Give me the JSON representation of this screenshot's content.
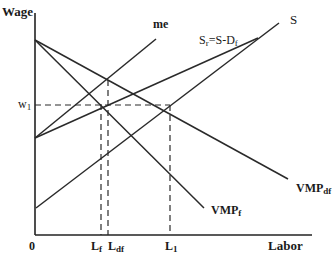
{
  "diagram": {
    "type": "labor-market-supply-demand",
    "axes": {
      "y_label": "Wage",
      "x_label": "Labor",
      "origin_label": "0"
    },
    "wage_levels": [
      {
        "label": "w",
        "subscript": "1"
      }
    ],
    "labor_levels": [
      {
        "label": "L",
        "subscript": "f"
      },
      {
        "label": "L",
        "subscript": "df"
      },
      {
        "label": "L",
        "subscript": "1"
      }
    ],
    "curves": [
      {
        "id": "vmp_df",
        "label": "VMP",
        "subscript": "df",
        "kind": "demand"
      },
      {
        "id": "vmp_f",
        "label": "VMP",
        "subscript": "f",
        "kind": "demand"
      },
      {
        "id": "me",
        "label": "me",
        "subscript": "",
        "kind": "marginal-expenditure"
      },
      {
        "id": "s_r",
        "label": "S",
        "subscript": "r",
        "suffix": "=S-D",
        "suffix_subscript": "f",
        "kind": "residual-supply"
      },
      {
        "id": "s",
        "label": "S",
        "subscript": "",
        "kind": "supply"
      }
    ]
  }
}
